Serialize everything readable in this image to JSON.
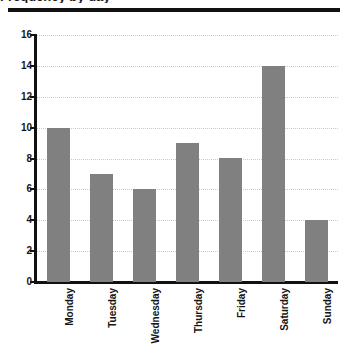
{
  "figure": {
    "title_remnant": "Frequency by day",
    "header_rule": "horizontal-rule"
  },
  "chart_data": {
    "type": "bar",
    "title": "",
    "xlabel": "",
    "ylabel": "",
    "categories": [
      "Monday",
      "Tuesday",
      "Wednesday",
      "Thursday",
      "Friday",
      "Saturday",
      "Sunday"
    ],
    "values": [
      10,
      7,
      6,
      9,
      8,
      14,
      4
    ],
    "ylim": [
      0,
      16
    ],
    "ytick_values": [
      0,
      2,
      4,
      6,
      8,
      10,
      12,
      14,
      16
    ],
    "ytick_labels": [
      "0",
      "2",
      "4",
      "6",
      "8",
      "10",
      "12",
      "14",
      "16"
    ],
    "grid": true,
    "grid_axis": "y",
    "grid_style": "dotted",
    "legend": null,
    "bar_color": "#808080",
    "axis_color": "#111111",
    "grid_color": "#c9c9c9",
    "xtick_rotation": -90
  }
}
